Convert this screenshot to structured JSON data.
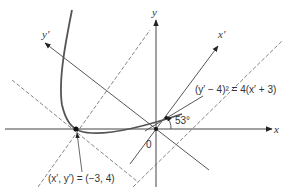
{
  "diagram": {
    "axes": {
      "x_label": "x",
      "y_label": "y",
      "x_prime_label": "x′",
      "y_prime_label": "y′",
      "origin_label": "0"
    },
    "angle_label": "53°",
    "equation_label": "(y′ − 4)² = 4(x′ + 3)",
    "vertex_label": "(x′, y′) = (−3, 4)",
    "colors": {
      "line": "#444444",
      "curve": "#555555",
      "background": "#ffffff"
    }
  }
}
